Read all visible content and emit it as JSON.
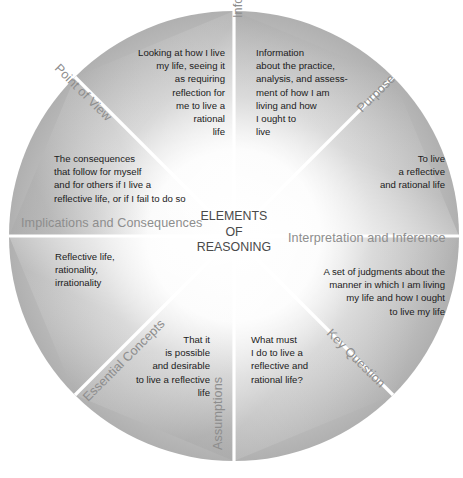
{
  "figure": {
    "center_title": "ELEMENTS\nOF\nREASONING",
    "shape": "circle-divided-into-eight-wedges",
    "background_color": "#ffffff",
    "wedge_fill_light": "#ffffff",
    "wedge_fill_dark": "#b4b4b4",
    "divider_color": "#ffffff",
    "body_text_color": "#1b1b1b",
    "label_text_color": "#8d8d8d",
    "center_text_color": "#4a4a4a"
  },
  "sections": [
    {
      "id": "information",
      "label": "Information",
      "body": "Information\nabout the practice,\nanalysis, and assess-\nment of how I am\nliving and how\nI ought to\nlive",
      "label_rotation_deg": -90,
      "text_align": "left"
    },
    {
      "id": "purpose",
      "label": "Purpose",
      "body": "To live\na reflective\nand rational life",
      "label_rotation_deg": -45,
      "text_align": "right"
    },
    {
      "id": "interpretation-and-inference",
      "label": "Interpretation and Inference",
      "body": "A set of judgments about the\nmanner in which I am living\nmy life and how I ought\nto live my life",
      "label_rotation_deg": 0,
      "text_align": "right"
    },
    {
      "id": "key-question",
      "label": "Key Question",
      "body": "What must\nI do to live a\nreflective and\nrational life?",
      "label_rotation_deg": 45,
      "text_align": "left"
    },
    {
      "id": "assumptions",
      "label": "Assumptions",
      "body": "That it\nis possible\nand desirable\nto live a reflective\nlife",
      "label_rotation_deg": -90,
      "text_align": "right"
    },
    {
      "id": "essential-concepts",
      "label": "Essential Concepts",
      "body": "Reflective life,\nrationality,\nirrationality",
      "label_rotation_deg": -45,
      "text_align": "left"
    },
    {
      "id": "implications-and-consequences",
      "label": "Implications and Consequences",
      "body": "The consequences\nthat follow for myself\nand for others if I live a\nreflective life, or if I fail to do so",
      "label_rotation_deg": 0,
      "text_align": "left"
    },
    {
      "id": "point-of-view",
      "label": "Point of View",
      "body": "Looking at how I live\nmy life, seeing it\nas requiring\nreflection for\nme to live a\nrational\nlife",
      "label_rotation_deg": 45,
      "text_align": "right"
    }
  ]
}
